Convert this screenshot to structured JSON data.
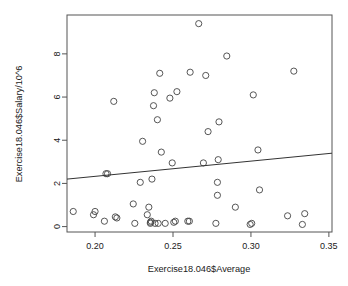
{
  "chart_data": {
    "type": "scatter",
    "title": "",
    "xlabel": "Exercise18.046$Average",
    "ylabel": "Exercise18.046$Salary/10^6",
    "xlim": [
      0.182,
      0.352
    ],
    "ylim": [
      -0.25,
      9.8
    ],
    "xticks": [
      0.2,
      0.25,
      0.3,
      0.35
    ],
    "xticklabels": [
      "0.20",
      "0.25",
      "0.30",
      "0.35"
    ],
    "yticks": [
      0,
      2,
      4,
      6,
      8
    ],
    "yticklabels": [
      "0",
      "2",
      "4",
      "6",
      "8"
    ],
    "grid": false,
    "legend": null,
    "point_marker": "open-circle",
    "point_color": "#444444",
    "line_color": "#333333",
    "frame_color": "#555555",
    "background": "#ffffff",
    "x": [
      0.186,
      0.199,
      0.2,
      0.206,
      0.207,
      0.208,
      0.212,
      0.213,
      0.214,
      0.2245,
      0.2255,
      0.229,
      0.2305,
      0.2335,
      0.2345,
      0.2355,
      0.2355,
      0.236,
      0.2365,
      0.2375,
      0.238,
      0.2385,
      0.24,
      0.2405,
      0.2415,
      0.2425,
      0.245,
      0.248,
      0.2495,
      0.2505,
      0.2515,
      0.2525,
      0.2595,
      0.2605,
      0.261,
      0.2665,
      0.2695,
      0.271,
      0.2725,
      0.2775,
      0.2785,
      0.2785,
      0.279,
      0.2795,
      0.2845,
      0.29,
      0.2995,
      0.3005,
      0.3015,
      0.3045,
      0.3055,
      0.3235,
      0.3275,
      0.333,
      0.3345
    ],
    "y": [
      0.7,
      0.55,
      0.7,
      0.25,
      2.45,
      2.45,
      5.8,
      0.45,
      0.4,
      1.05,
      0.15,
      2.05,
      3.95,
      0.55,
      0.9,
      0.15,
      0.2,
      0.25,
      2.2,
      5.6,
      6.2,
      0.15,
      4.95,
      0.15,
      7.1,
      3.45,
      0.15,
      5.95,
      2.95,
      0.2,
      0.25,
      6.25,
      0.25,
      0.25,
      7.15,
      9.4,
      2.95,
      7.0,
      4.4,
      0.15,
      1.45,
      2.05,
      3.1,
      4.85,
      7.9,
      0.9,
      0.1,
      0.15,
      6.1,
      3.55,
      1.7,
      0.5,
      7.2,
      0.1,
      0.6
    ],
    "regression_line": {
      "x": [
        0.182,
        0.352
      ],
      "y": [
        2.2,
        3.4
      ],
      "slope": 7.06,
      "intercept": 0.915
    }
  }
}
